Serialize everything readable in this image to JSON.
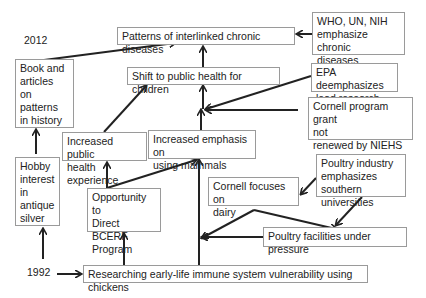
{
  "diagram": {
    "years": {
      "start": "1992",
      "end": "2012"
    },
    "nodes": {
      "patterns": "Patterns of interlinked chronic diseases",
      "who": "WHO, UN, NIH\nemphasize chronic\ndiseases",
      "book": "Book and\narticles\non patterns\n in history",
      "shift": "Shift to public health for children",
      "epa": "EPA deemphasizes\nlead research",
      "cornell_grant": "Cornell program grant\nnot\nrenewed by NIEHS",
      "public_health": "Increased public\nhealth experience",
      "mammals": "Increased emphasis  on\nusing mammals",
      "hobby": "Hobby\ninterest\nin\nantique\nsilver",
      "bcerf": "Opportunity to\nDirect BCERF\nProgram",
      "dairy": "Cornell focuses on\ndairy",
      "poultry_industry": "Poultry industry\nemphasizes\nsouthern universities",
      "poultry_facilities": "Poultry facilities under pressure",
      "researching": "Researching early-life immune system vulnerability using chickens"
    },
    "edges": [
      [
        "1992",
        "researching"
      ],
      [
        "1992",
        "hobby"
      ],
      [
        "hobby",
        "book"
      ],
      [
        "book",
        "patterns"
      ],
      [
        "researching",
        "bcerf"
      ],
      [
        "researching",
        "mammals"
      ],
      [
        "bcerf",
        "public_health"
      ],
      [
        "bcerf",
        "mammals"
      ],
      [
        "public_health",
        "shift"
      ],
      [
        "mammals",
        "shift"
      ],
      [
        "shift",
        "patterns"
      ],
      [
        "epa",
        "shift"
      ],
      [
        "cornell_grant",
        "shift"
      ],
      [
        "who",
        "patterns"
      ],
      [
        "dairy",
        "researching"
      ],
      [
        "dairy",
        "poultry_facilities"
      ],
      [
        "poultry_industry",
        "dairy"
      ],
      [
        "poultry_industry",
        "poultry_facilities"
      ],
      [
        "poultry_facilities",
        "researching"
      ]
    ]
  }
}
